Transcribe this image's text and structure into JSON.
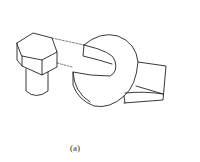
{
  "figure": {
    "label": "(a)",
    "parts": [
      "hex-bolt",
      "open-end-wrench",
      "alignment-lines"
    ]
  }
}
